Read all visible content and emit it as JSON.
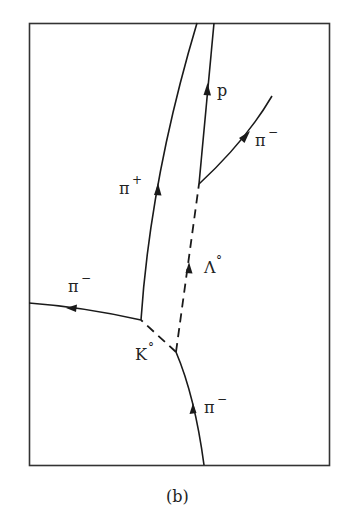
{
  "figure": {
    "caption": "(b)",
    "colors": {
      "ink": "#1a1a1a",
      "frame": "#333333",
      "background": "#ffffff"
    }
  },
  "labels": {
    "proton": "p",
    "pi_minus_right": "π",
    "pi_minus_right_sup": "−",
    "pi_plus": "π",
    "pi_plus_sup": "+",
    "lambda": "Λ",
    "lambda_sup": "°",
    "pi_minus_left": "π",
    "pi_minus_left_sup": "−",
    "kaon": "K",
    "kaon_sup": "°",
    "pi_minus_bottom": "π",
    "pi_minus_bottom_sup": "−"
  },
  "tracks": [
    {
      "name": "pi-minus-incoming",
      "style": "solid"
    },
    {
      "name": "kaon-neutral",
      "style": "dashed"
    },
    {
      "name": "lambda-neutral",
      "style": "dashed"
    },
    {
      "name": "pi-plus",
      "style": "solid"
    },
    {
      "name": "pi-minus-left",
      "style": "solid"
    },
    {
      "name": "proton",
      "style": "solid"
    },
    {
      "name": "pi-minus-right",
      "style": "solid"
    }
  ]
}
